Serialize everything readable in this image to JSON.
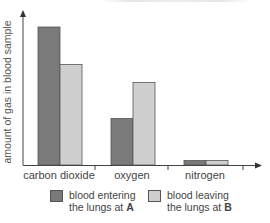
{
  "chart_data": {
    "type": "bar",
    "title": "",
    "xlabel": "",
    "ylabel": "amount of gas in blood sample",
    "categories": [
      "carbon dioxide",
      "oxygen",
      "nitrogen"
    ],
    "series": [
      {
        "name": "blood entering the lungs at A",
        "color": "#7a7a7a",
        "values": [
          9.2,
          3.1,
          0.3
        ]
      },
      {
        "name": "blood leaving the lungs at B",
        "color": "#cfcfcf",
        "values": [
          6.7,
          5.5,
          0.3
        ]
      }
    ],
    "ylim": [
      0,
      10
    ],
    "grid": false,
    "y_ticks_shown": false,
    "legend_position": "bottom"
  },
  "legend": {
    "items": [
      {
        "line1": "blood entering",
        "line2_prefix": "the lungs at ",
        "line2_bold": "A",
        "color": "#7a7a7a"
      },
      {
        "line1": "blood leaving",
        "line2_prefix": "the lungs at ",
        "line2_bold": "B",
        "color": "#cfcfcf"
      }
    ]
  }
}
